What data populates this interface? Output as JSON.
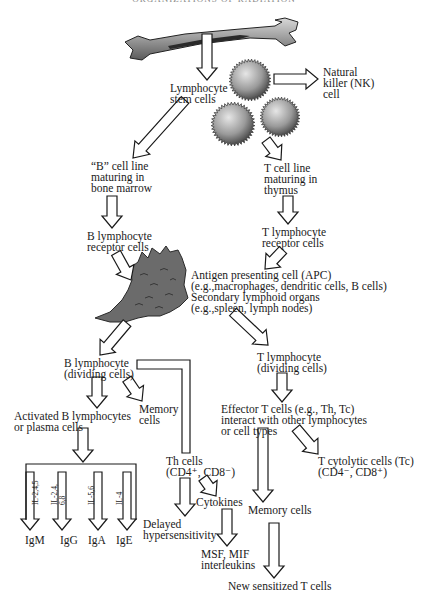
{
  "header": {
    "title": "ORGANIZATIONS OF RADIATION"
  },
  "nodes": {
    "stem": "Lymphocyte\nstem cells",
    "nk": "Natural\nkiller (NK)\ncell",
    "b_line": "“B” cell line\nmaturing in\nbone marrow",
    "t_line": "T cell line\nmaturing in\nthymus",
    "b_receptor": "B lymphocyte\nreceptor cells",
    "t_receptor": "T lymphocyte\nreceptor cells",
    "apc": "Antigen presenting cell (APC)\n(e.g.,macrophages, dendritic cells, B cells)\nSecondary lymphoid organs\n(e.g.,spleen, lymph nodes)",
    "b_dividing": "B lymphocyte\n(dividing cells)",
    "t_dividing": "T lymphocyte\n(dividing cells)",
    "activated_b": "Activated B lymphocytes\nor plasma cells",
    "b_memory": "Memory\ncells",
    "th_cells": "Th cells\n(CD4⁺, CD8⁻)",
    "effector_t": "Effector T cells (e.g., Th, Tc)\ninteract with other lymphocytes\nor cell types",
    "tc_cells": "T cytolytic cells (Tc)\n(CD4⁻, CD8⁺)",
    "cytokines": "Cytokines",
    "delayed": "Delayed\nhypersensitivity",
    "t_memory": "Memory cells",
    "msf": "MSF, MIF\ninterleukins",
    "new_t": "New sensitized T cells"
  },
  "interleukins": [
    {
      "label": "IL-2,4,5",
      "ig": "IgM"
    },
    {
      "label": "IL-2,4,\n6,8",
      "ig": "IgG"
    },
    {
      "label": "IL-5,6",
      "ig": "IgA"
    },
    {
      "label": "IL-4",
      "ig": "IgE"
    }
  ],
  "illustrations": {
    "bone": "long-bone-illustration",
    "cells": "lymphocyte-cell-illustrations",
    "apc": "dendritic-cell-illustration"
  }
}
